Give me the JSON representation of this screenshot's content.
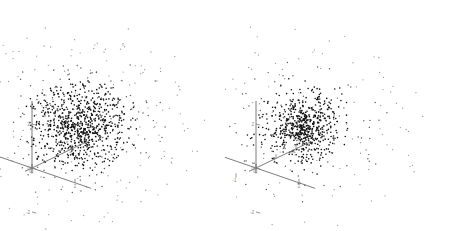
{
  "figure": {
    "background_color": "#ffffff",
    "panel_count": 2,
    "axis_color": "#6e6e6e",
    "point_color": "#111111",
    "tick_label_color": "#8a8a8a"
  },
  "chart_data": [
    {
      "type": "scatter",
      "name": "left-panel",
      "projection": "3d",
      "title": "",
      "xlabel": "",
      "ylabel": "",
      "zlabel": "",
      "grid": false,
      "legend": null,
      "xlim": [
        -3,
        3
      ],
      "ylim": [
        -3,
        3
      ],
      "zlim": [
        -3,
        3
      ],
      "xticks": [
        -2,
        0,
        2
      ],
      "yticks": [
        0,
        2
      ],
      "zticks": [
        -2,
        0,
        2
      ],
      "xtick_labels": [
        "-2",
        "0",
        "2"
      ],
      "ytick_labels": [
        "0",
        "2"
      ],
      "ztick_labels": [
        "-2",
        "0",
        "2"
      ],
      "description": "Dense dark central core surrounded by a distinct dense annulus ring and a sparse outer halo of scattered points",
      "structure": {
        "core_points": 520,
        "core_radius": 0.75,
        "ring_points": 300,
        "ring_radius": 1.75,
        "ring_width": 0.35,
        "halo_points": 230,
        "halo_radius_min": 2.2,
        "halo_radius_max": 4.3
      }
    },
    {
      "type": "scatter",
      "name": "right-panel",
      "projection": "3d",
      "title": "",
      "xlabel": "",
      "ylabel": "",
      "zlabel": "",
      "grid": false,
      "legend": null,
      "xlim": [
        -3,
        3
      ],
      "ylim": [
        -3,
        3
      ],
      "zlim": [
        -3,
        3
      ],
      "xticks": [
        -2,
        0,
        2
      ],
      "yticks": [
        -1,
        0,
        1,
        2
      ],
      "zticks": [
        -2,
        0,
        2
      ],
      "xtick_labels": [
        "-2",
        "0",
        "2"
      ],
      "ytick_labels": [
        "-1",
        "0",
        "1",
        "2"
      ],
      "ztick_labels": [
        "-2",
        "0",
        "2"
      ],
      "description": "Tight dense dark central cluster surrounded by uniformly sparse scattered outlier points with no ring structure",
      "structure": {
        "core_points": 520,
        "core_radius": 0.62,
        "ring_points": 0,
        "halo_points": 230,
        "halo_radius_min": 1.1,
        "halo_radius_max": 4.4
      }
    }
  ]
}
